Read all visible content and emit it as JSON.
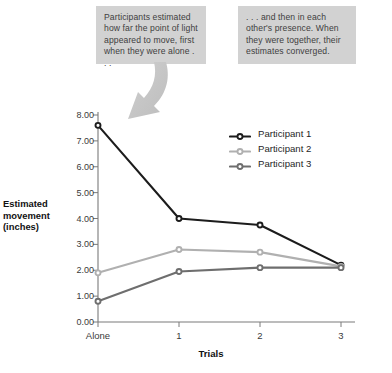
{
  "annotations": {
    "left_callout": "Participants estimated how far the point of light appeared to move, first when they were alone . . .",
    "right_callout": ". . . and then in each other's presence. When they were together, their estimates converged.",
    "arrow_name": "curved-arrow-pointing-to-first-data-point"
  },
  "chart_data": {
    "type": "line",
    "title": "",
    "subtitle": "",
    "xlabel": "Trials",
    "ylabel": "Estimated movement (inches)",
    "categories": [
      "Alone",
      "1",
      "2",
      "3"
    ],
    "series": [
      {
        "name": "Participant 1",
        "color": "#1c1c1c",
        "values": [
          7.6,
          4.0,
          3.75,
          2.2
        ]
      },
      {
        "name": "Participant 2",
        "color": "#b0b0b0",
        "values": [
          1.9,
          2.8,
          2.7,
          2.15
        ]
      },
      {
        "name": "Participant 3",
        "color": "#6e6e6e",
        "values": [
          0.8,
          1.95,
          2.1,
          2.1
        ]
      }
    ],
    "ylim": [
      0.0,
      8.0
    ],
    "yticks": [
      "0.00",
      "1.00",
      "2.00",
      "3.00",
      "4.00",
      "5.00",
      "6.00",
      "7.00",
      "8.00"
    ],
    "ytick_values": [
      0,
      1,
      2,
      3,
      4,
      5,
      6,
      7,
      8
    ],
    "xticks": [
      "Alone",
      "1",
      "2",
      "3"
    ],
    "grid": false,
    "legend_position": "upper-right-inside",
    "marker": "open-circle"
  },
  "colors": {
    "participant_1": "#1c1c1c",
    "participant_2": "#b0b0b0",
    "participant_3": "#6e6e6e",
    "axis": "#7a7a7a",
    "callout_background": "#d2d2d2",
    "callout_text": "#404040",
    "arrow": "#c4c4c4"
  }
}
